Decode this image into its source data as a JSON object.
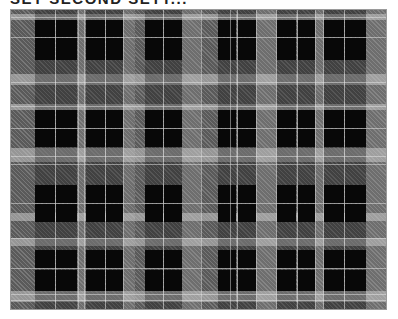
{
  "caption": {
    "text": "SET SECOND SETT..."
  },
  "pattern": {
    "name": "black-and-gray tartan plaid",
    "colors": {
      "black": "#0c0c0c",
      "dark_gray": "#5a5a5a",
      "mid_gray": "#6e6e6e",
      "light_gray": "#8a8a8a",
      "white_line": "#e6e6e6",
      "frame_border": "#9a9a9a"
    },
    "vertical_black_blocks": [
      [
        24,
        44
      ],
      [
        45,
        66
      ],
      [
        75,
        94
      ],
      [
        95,
        112
      ],
      [
        134,
        152
      ],
      [
        153,
        171
      ],
      [
        207,
        225
      ],
      [
        227,
        245
      ],
      [
        266,
        285
      ],
      [
        287,
        304
      ],
      [
        313,
        333
      ],
      [
        334,
        355
      ]
    ],
    "vertical_light_stripes": [
      [
        66,
        75
      ],
      [
        112,
        124
      ],
      [
        171,
        190
      ],
      [
        245,
        266
      ],
      [
        304,
        313
      ],
      [
        355,
        376
      ]
    ],
    "vertical_white_lines": [
      44,
      67,
      73,
      94,
      112,
      152,
      190,
      219,
      226,
      245,
      265,
      286,
      304,
      312,
      333
    ],
    "horizontal_light_bands": [
      [
        4,
        10
      ],
      [
        64,
        75
      ],
      [
        94,
        100
      ],
      [
        138,
        152
      ],
      [
        203,
        211
      ],
      [
        228,
        236
      ],
      [
        281,
        292
      ]
    ],
    "horizontal_black_blocks": [
      [
        10,
        27
      ],
      [
        28,
        50
      ],
      [
        100,
        118
      ],
      [
        119,
        137
      ],
      [
        175,
        193
      ],
      [
        194,
        212
      ],
      [
        240,
        258
      ],
      [
        260,
        281
      ]
    ],
    "horizontal_white_lines": [
      7,
      27,
      72,
      96,
      118,
      146,
      154,
      193,
      228,
      258,
      284,
      290
    ]
  }
}
